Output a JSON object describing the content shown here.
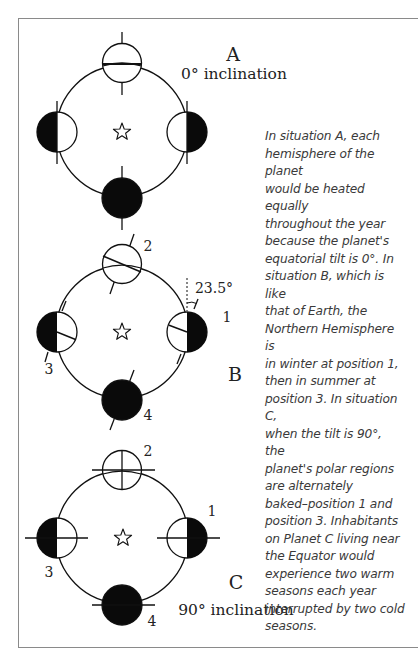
{
  "figure": {
    "caption": "In situation A, each\nhemisphere of the planet\nwould be heated equally\nthroughout the year\nbecause the planet's\nequatorial tilt is 0°. In\nsituation B, which is like\nthat of Earth, the\nNorthern Hemisphere is\nin winter at position 1,\nthen in summer at\nposition 3. In situation C,\nwhen the tilt is 90°, the\nplanet's polar regions\nare alternately\nbaked–position 1 and\nposition 3. Inhabitants\non Planet C living near\nthe Equator would\nexperience two warm\nseasons each year\ninterrupted by two cold\nseasons.",
    "center_icon": "star-icon",
    "colors": {
      "line": "#111111",
      "shadow": "#0a0a0a",
      "lit": "#ffffff",
      "frame": "#8a8a8a",
      "caption_text": "#3a3a3a"
    },
    "situations": [
      {
        "id": "A",
        "label": "A",
        "inclination_label": "0° inclination",
        "tilt_degrees": 0,
        "position_numbers_shown": false
      },
      {
        "id": "B",
        "label": "B",
        "inclination_label": "",
        "tilt_degrees": 23.5,
        "tilt_annotation": "23.5°",
        "position_numbers_shown": true,
        "positions": [
          "1",
          "2",
          "3",
          "4"
        ]
      },
      {
        "id": "C",
        "label": "C",
        "inclination_label": "90° inclination",
        "tilt_degrees": 90,
        "position_numbers_shown": true,
        "positions": [
          "1",
          "2",
          "3",
          "4"
        ]
      }
    ]
  }
}
